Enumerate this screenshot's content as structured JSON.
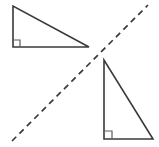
{
  "figure": {
    "title": "Two congruent right triangles reflected across a dashed line",
    "background_color": "#ffffff",
    "stroke_color": "#3a3a3a",
    "mark_color": "#5c5c5c",
    "width": 159,
    "height": 147,
    "shapes": [
      {
        "id": "triangle-upper-left",
        "name": "upper-left-right-triangle",
        "type": "right-triangle",
        "points": "13,6 13,47 89,47",
        "vertices": [
          {
            "label": "top-left",
            "x": 13,
            "y": 6
          },
          {
            "label": "bottom-left",
            "x": 13,
            "y": 47
          },
          {
            "label": "bottom-right",
            "x": 89,
            "y": 47
          }
        ],
        "right_angle_vertex": "bottom-left",
        "right_angle_mark_path": "M 13 40 L 20 40 L 20 47",
        "leg_vertical_length": 41,
        "leg_horizontal_length": 76
      },
      {
        "id": "triangle-lower-right",
        "name": "lower-right-right-triangle",
        "type": "right-triangle",
        "points": "104,60 104,139 153,139",
        "vertices": [
          {
            "label": "top-left",
            "x": 104,
            "y": 60
          },
          {
            "label": "bottom-left",
            "x": 104,
            "y": 139
          },
          {
            "label": "bottom-right",
            "x": 153,
            "y": 139
          }
        ],
        "right_angle_vertex": "bottom-left",
        "right_angle_mark_path": "M 104 131 L 112 131 L 112 139",
        "leg_vertical_length": 79,
        "leg_horizontal_length": 49
      }
    ],
    "mirror_line": {
      "id": "dashed-diagonal",
      "name": "dashed-line-of-reflection",
      "style": "dashed",
      "x1": 12,
      "y1": 141,
      "x2": 148,
      "y2": 5,
      "dash_pattern": "6 4.5"
    }
  }
}
